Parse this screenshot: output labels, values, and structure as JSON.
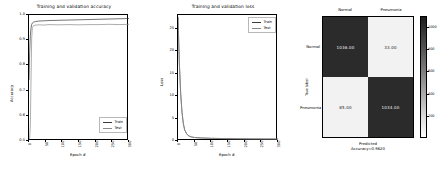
{
  "figure": {
    "background": "#ffffff",
    "line_color_train": "#3a3a3a",
    "line_color_test": "#6f6f6f"
  },
  "chart_data": [
    {
      "type": "line",
      "title": "Training and validation accuracy",
      "xlabel": "Epoch #",
      "ylabel": "Accuracy",
      "xlim": [
        0,
        300
      ],
      "ylim": [
        0.5,
        1.0
      ],
      "xticks": [
        0,
        50,
        100,
        150,
        200,
        250,
        300
      ],
      "yticks": [
        0.5,
        0.6,
        0.7,
        0.8,
        0.9,
        1.0
      ],
      "ytick_labels": [
        "0.5",
        "0.6",
        "0.7",
        "0.8",
        "0.9",
        "1.0"
      ],
      "xtick_labels": [
        "0",
        "50",
        "100",
        "150",
        "200",
        "250",
        "300"
      ],
      "grid": false,
      "legend_position": "lower right",
      "series": [
        {
          "name": "Train",
          "x": [
            0,
            2,
            4,
            6,
            8,
            10,
            14,
            20,
            30,
            45,
            60,
            90,
            120,
            150,
            180,
            210,
            240,
            270,
            300
          ],
          "values": [
            0.742,
            0.852,
            0.918,
            0.948,
            0.962,
            0.968,
            0.972,
            0.974,
            0.976,
            0.977,
            0.978,
            0.979,
            0.98,
            0.981,
            0.982,
            0.983,
            0.984,
            0.985,
            0.986
          ]
        },
        {
          "name": "Test",
          "x": [
            0,
            2,
            4,
            6,
            8,
            10,
            14,
            20,
            30,
            45,
            60,
            90,
            120,
            150,
            180,
            210,
            240,
            270,
            300
          ],
          "values": [
            0.505,
            0.512,
            0.56,
            0.742,
            0.905,
            0.95,
            0.958,
            0.96,
            0.961,
            0.96,
            0.962,
            0.961,
            0.962,
            0.961,
            0.962,
            0.962,
            0.963,
            0.962,
            0.963
          ]
        }
      ]
    },
    {
      "type": "line",
      "title": "Training and validation loss",
      "xlabel": "Epoch #",
      "ylabel": "Loss",
      "xlim": [
        0,
        300
      ],
      "ylim": [
        0,
        28
      ],
      "xticks": [
        0,
        50,
        100,
        150,
        200,
        250,
        300
      ],
      "yticks": [
        0,
        5,
        10,
        15,
        20,
        25
      ],
      "ytick_labels": [
        "0",
        "5",
        "10",
        "15",
        "20",
        "25"
      ],
      "xtick_labels": [
        "0",
        "50",
        "100",
        "150",
        "200",
        "250",
        "300"
      ],
      "grid": false,
      "legend_position": "upper right",
      "series": [
        {
          "name": "Train",
          "x": [
            0,
            4,
            8,
            12,
            16,
            20,
            26,
            32,
            40,
            50,
            70,
            100,
            140,
            180,
            220,
            260,
            300
          ],
          "values": [
            27.6,
            17.4,
            10.6,
            6.4,
            3.9,
            2.5,
            1.6,
            1.15,
            0.9,
            0.78,
            0.68,
            0.6,
            0.54,
            0.5,
            0.47,
            0.45,
            0.44
          ]
        },
        {
          "name": "Test",
          "x": [
            0,
            4,
            8,
            12,
            16,
            20,
            26,
            32,
            40,
            50,
            70,
            100,
            140,
            180,
            220,
            260,
            300
          ],
          "values": [
            27.4,
            17.2,
            10.4,
            6.3,
            3.8,
            2.45,
            1.58,
            1.12,
            0.88,
            0.76,
            0.66,
            0.58,
            0.52,
            0.48,
            0.46,
            0.44,
            0.43
          ]
        }
      ]
    },
    {
      "type": "heatmap",
      "title": "",
      "xlabel": "Predicted",
      "ylabel": "True label",
      "accuracy_text": "Accuracy=0.9620",
      "x_categories": [
        "Normal",
        "Pneumonia"
      ],
      "y_categories": [
        "Normal",
        "Pneumonia"
      ],
      "values": [
        [
          1036.0,
          33.0
        ],
        [
          85.0,
          1034.0
        ]
      ],
      "cell_labels": [
        [
          "1036.00",
          "33.00"
        ],
        [
          "85.00",
          "1034.00"
        ]
      ],
      "colorbar": {
        "ticks": [
          1000,
          800,
          600,
          400,
          200
        ],
        "tick_labels": [
          "1000",
          "800",
          "600",
          "400",
          "200"
        ]
      }
    }
  ],
  "legend_labels": {
    "train": "Train",
    "test": "Test"
  }
}
